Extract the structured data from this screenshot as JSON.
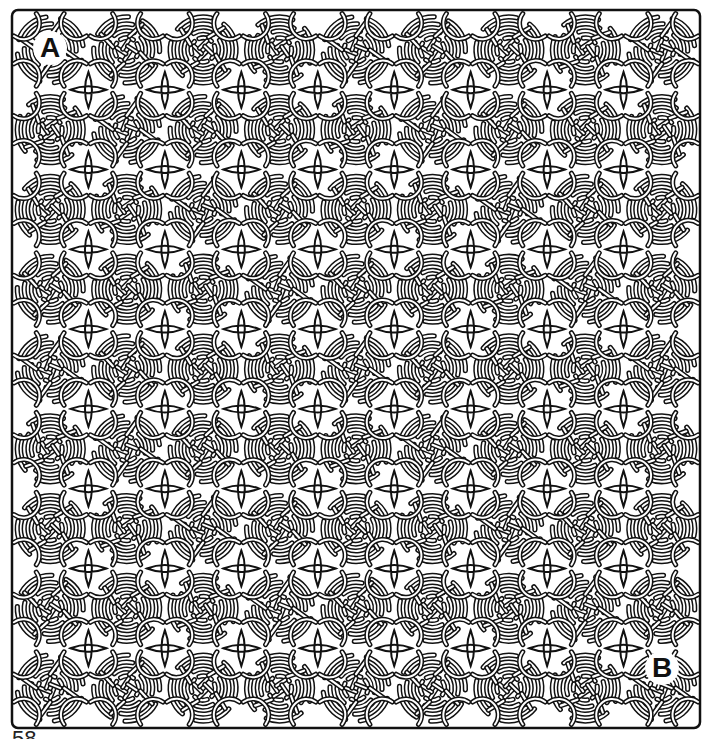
{
  "puzzle": {
    "type": "celtic-knot-maze",
    "start_label": "A",
    "end_label": "B",
    "grid": {
      "columns": 9,
      "rows": 9
    },
    "colors": {
      "line": "#111111",
      "background": "#ffffff"
    }
  },
  "page": {
    "number": "58"
  }
}
